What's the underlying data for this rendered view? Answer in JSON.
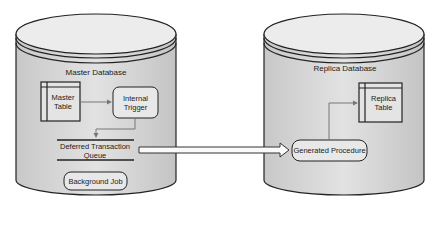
{
  "master": {
    "title": "Master Database",
    "table": "Master\nTable",
    "table_l1": "Master",
    "table_l2": "Table",
    "trigger_l1": "Internal",
    "trigger_l2": "Trigger",
    "queue_l1": "Deferred Transaction",
    "queue_l2": "Queue",
    "job": "Background Job"
  },
  "replica": {
    "title": "Replica Database",
    "table_l1": "Replica",
    "table_l2": "Table",
    "procedure": "Generated Procedure"
  },
  "colors": {
    "cylinder_fill": "#d9d9d9",
    "box_fill": "#e6e6e6",
    "stroke": "#222222"
  }
}
